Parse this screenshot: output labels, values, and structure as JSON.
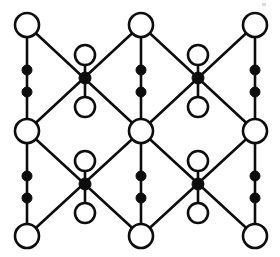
{
  "diagram": {
    "type": "node-link-lattice",
    "canvas": {
      "width": 280,
      "height": 257,
      "background": "#ffffff"
    },
    "style": {
      "line_color": "#0d0d0d",
      "line_width": 2.6,
      "open_node_fill": "#ffffff",
      "open_node_stroke": "#0d0d0d",
      "filled_node_fill": "#0d0d0d",
      "large_open_radius": 12,
      "small_open_radius": 10,
      "small_dot_radius": 5,
      "cross_dot_radius": 6
    },
    "columns_x": [
      27,
      85,
      141,
      198,
      255
    ],
    "rows_y": [
      25,
      70,
      78,
      90,
      105,
      130,
      160,
      175,
      185,
      195,
      212,
      235
    ],
    "nodes": [
      {
        "id": "c1-top",
        "name": "open-circle-large",
        "kind": "open-large",
        "x": 27,
        "y": 25
      },
      {
        "id": "c3-top",
        "name": "open-circle-large",
        "kind": "open-large",
        "x": 141,
        "y": 25
      },
      {
        "id": "c5-top",
        "name": "open-circle-large",
        "kind": "open-large",
        "x": 255,
        "y": 25
      },
      {
        "id": "c2-upper-open",
        "name": "open-circle-small",
        "kind": "open-small",
        "x": 85,
        "y": 55
      },
      {
        "id": "c4-upper-open",
        "name": "open-circle-small",
        "kind": "open-small",
        "x": 198,
        "y": 55
      },
      {
        "id": "c1-dot-a",
        "name": "filled-dot",
        "kind": "filled-dot",
        "x": 27,
        "y": 70
      },
      {
        "id": "c3-dot-a",
        "name": "filled-dot",
        "kind": "filled-dot",
        "x": 141,
        "y": 70
      },
      {
        "id": "c5-dot-a",
        "name": "filled-dot",
        "kind": "filled-dot",
        "x": 255,
        "y": 70
      },
      {
        "id": "c2-cross-top",
        "name": "filled-crossing-node",
        "kind": "filled-cross",
        "x": 85,
        "y": 78
      },
      {
        "id": "c4-cross-top",
        "name": "filled-crossing-node",
        "kind": "filled-cross",
        "x": 198,
        "y": 78
      },
      {
        "id": "c1-dot-b",
        "name": "filled-dot",
        "kind": "filled-dot",
        "x": 27,
        "y": 92
      },
      {
        "id": "c3-dot-b",
        "name": "filled-dot",
        "kind": "filled-dot",
        "x": 141,
        "y": 92
      },
      {
        "id": "c5-dot-b",
        "name": "filled-dot",
        "kind": "filled-dot",
        "x": 255,
        "y": 92
      },
      {
        "id": "c2-lower-open",
        "name": "open-circle-small",
        "kind": "open-small",
        "x": 85,
        "y": 107
      },
      {
        "id": "c4-lower-open",
        "name": "open-circle-small",
        "kind": "open-small",
        "x": 198,
        "y": 107
      },
      {
        "id": "c1-mid",
        "name": "open-circle-large",
        "kind": "open-large",
        "x": 27,
        "y": 131
      },
      {
        "id": "c3-mid",
        "name": "open-circle-large",
        "kind": "open-large",
        "x": 141,
        "y": 131
      },
      {
        "id": "c5-mid",
        "name": "open-circle-large",
        "kind": "open-large",
        "x": 255,
        "y": 131
      },
      {
        "id": "c2-upper2-open",
        "name": "open-circle-small",
        "kind": "open-small",
        "x": 85,
        "y": 161
      },
      {
        "id": "c4-upper2-open",
        "name": "open-circle-small",
        "kind": "open-small",
        "x": 198,
        "y": 161
      },
      {
        "id": "c1-dot-c",
        "name": "filled-dot",
        "kind": "filled-dot",
        "x": 27,
        "y": 176
      },
      {
        "id": "c3-dot-c",
        "name": "filled-dot",
        "kind": "filled-dot",
        "x": 141,
        "y": 176
      },
      {
        "id": "c5-dot-c",
        "name": "filled-dot",
        "kind": "filled-dot",
        "x": 255,
        "y": 176
      },
      {
        "id": "c2-cross-bot",
        "name": "filled-crossing-node",
        "kind": "filled-cross",
        "x": 85,
        "y": 184
      },
      {
        "id": "c4-cross-bot",
        "name": "filled-crossing-node",
        "kind": "filled-cross",
        "x": 198,
        "y": 184
      },
      {
        "id": "c1-dot-d",
        "name": "filled-dot",
        "kind": "filled-dot",
        "x": 27,
        "y": 198
      },
      {
        "id": "c3-dot-d",
        "name": "filled-dot",
        "kind": "filled-dot",
        "x": 141,
        "y": 198
      },
      {
        "id": "c5-dot-d",
        "name": "filled-dot",
        "kind": "filled-dot",
        "x": 255,
        "y": 198
      },
      {
        "id": "c2-bot-open",
        "name": "open-circle-small",
        "kind": "open-small",
        "x": 85,
        "y": 213
      },
      {
        "id": "c4-bot-open",
        "name": "open-circle-small",
        "kind": "open-small",
        "x": 198,
        "y": 213
      },
      {
        "id": "c1-bottom",
        "name": "open-circle-large",
        "kind": "open-large",
        "x": 27,
        "y": 236
      },
      {
        "id": "c3-bottom",
        "name": "open-circle-large",
        "kind": "open-large",
        "x": 141,
        "y": 236
      },
      {
        "id": "c5-bottom",
        "name": "open-circle-large",
        "kind": "open-large",
        "x": 255,
        "y": 236
      }
    ],
    "edges": [
      {
        "name": "vertical-edge",
        "x1": 27,
        "y1": 25,
        "x2": 27,
        "y2": 92
      },
      {
        "name": "vertical-edge",
        "x1": 27,
        "y1": 92,
        "x2": 27,
        "y2": 131
      },
      {
        "name": "vertical-edge",
        "x1": 27,
        "y1": 131,
        "x2": 27,
        "y2": 198
      },
      {
        "name": "vertical-edge",
        "x1": 27,
        "y1": 198,
        "x2": 27,
        "y2": 236
      },
      {
        "name": "vertical-edge",
        "x1": 141,
        "y1": 25,
        "x2": 141,
        "y2": 92
      },
      {
        "name": "vertical-edge",
        "x1": 141,
        "y1": 92,
        "x2": 141,
        "y2": 131
      },
      {
        "name": "vertical-edge",
        "x1": 141,
        "y1": 131,
        "x2": 141,
        "y2": 198
      },
      {
        "name": "vertical-edge",
        "x1": 141,
        "y1": 198,
        "x2": 141,
        "y2": 236
      },
      {
        "name": "vertical-edge",
        "x1": 255,
        "y1": 25,
        "x2": 255,
        "y2": 92
      },
      {
        "name": "vertical-edge",
        "x1": 255,
        "y1": 92,
        "x2": 255,
        "y2": 131
      },
      {
        "name": "vertical-edge",
        "x1": 255,
        "y1": 131,
        "x2": 255,
        "y2": 198
      },
      {
        "name": "vertical-edge",
        "x1": 255,
        "y1": 198,
        "x2": 255,
        "y2": 236
      },
      {
        "name": "vertical-edge",
        "x1": 85,
        "y1": 55,
        "x2": 85,
        "y2": 107
      },
      {
        "name": "vertical-edge",
        "x1": 198,
        "y1": 55,
        "x2": 198,
        "y2": 107
      },
      {
        "name": "vertical-edge",
        "x1": 85,
        "y1": 161,
        "x2": 85,
        "y2": 213
      },
      {
        "name": "vertical-edge",
        "x1": 198,
        "y1": 161,
        "x2": 198,
        "y2": 213
      },
      {
        "name": "diagonal-edge",
        "x1": 27,
        "y1": 25,
        "x2": 141,
        "y2": 131
      },
      {
        "name": "diagonal-edge",
        "x1": 141,
        "y1": 25,
        "x2": 27,
        "y2": 131
      },
      {
        "name": "diagonal-edge",
        "x1": 141,
        "y1": 25,
        "x2": 255,
        "y2": 131
      },
      {
        "name": "diagonal-edge",
        "x1": 255,
        "y1": 25,
        "x2": 141,
        "y2": 131
      },
      {
        "name": "diagonal-edge",
        "x1": 27,
        "y1": 131,
        "x2": 141,
        "y2": 236
      },
      {
        "name": "diagonal-edge",
        "x1": 141,
        "y1": 131,
        "x2": 27,
        "y2": 236
      },
      {
        "name": "diagonal-edge",
        "x1": 141,
        "y1": 131,
        "x2": 255,
        "y2": 236
      },
      {
        "name": "diagonal-edge",
        "x1": 255,
        "y1": 131,
        "x2": 141,
        "y2": 236
      }
    ],
    "specks": [
      {
        "name": "scan-speck",
        "x": 262,
        "y": 3,
        "w": 4,
        "h": 3
      }
    ],
    "legend": {
      "large_open": "degree-4 lattice vertex",
      "small_open": "pendant vertex",
      "filled_dot": "subdivision vertex",
      "filled_cross": "crossing vertex"
    }
  }
}
